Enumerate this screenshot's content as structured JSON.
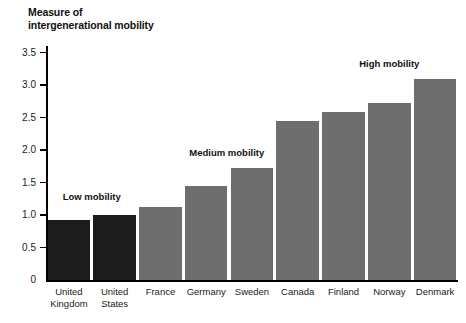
{
  "chart_data": {
    "type": "bar",
    "title": "Measure of\nintergenerational mobility",
    "xlabel": "",
    "ylabel": "Measure of intergenerational mobility",
    "ylim": [
      0,
      3.6
    ],
    "grid": false,
    "legend": "none",
    "ytick_labels": [
      "0",
      "0.5",
      "1.0",
      "1.5",
      "2.0",
      "2.5",
      "3.0",
      "3.5"
    ],
    "ytick_values": [
      0,
      0.5,
      1.0,
      1.5,
      2.0,
      2.5,
      3.0,
      3.5
    ],
    "categories": [
      "United\nKingdom",
      "United\nStates",
      "France",
      "Germany",
      "Sweden",
      "Canada",
      "Finland",
      "Norway",
      "Denmark"
    ],
    "values": [
      0.93,
      1.0,
      1.13,
      1.45,
      1.72,
      2.45,
      2.58,
      2.73,
      3.1
    ],
    "bar_colors": [
      "#1c1c1c",
      "#1c1c1c",
      "#6e6e6e",
      "#6e6e6e",
      "#6e6e6e",
      "#6e6e6e",
      "#6e6e6e",
      "#6e6e6e",
      "#6e6e6e"
    ],
    "annotations": [
      {
        "text": "Low mobility",
        "x": 0.5,
        "y": 1.28
      },
      {
        "text": "Medium mobility",
        "x": 3.45,
        "y": 1.95
      },
      {
        "text": "High mobility",
        "x": 7.0,
        "y": 3.32
      }
    ]
  },
  "colors": {
    "dark_bar": "#1c1c1c",
    "gray_bar": "#6e6e6e",
    "axis": "#000000",
    "text": "#1a1a1a",
    "background": "#ffffff"
  }
}
